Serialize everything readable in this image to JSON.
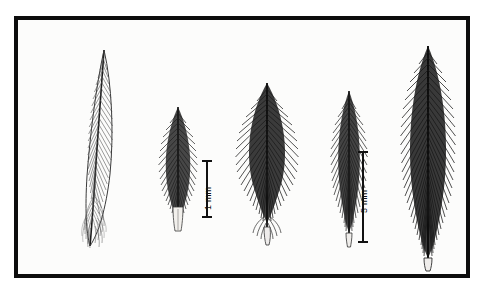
{
  "figure": {
    "name": "feather-plate",
    "background_color": "#ffffff",
    "frame_color": "#0d0d0d",
    "plate_background": "#fcfcfb",
    "ink_color": "#1a1a1a"
  },
  "specimens": [
    {
      "id": "specimen-1",
      "name": "contour-feather-whole",
      "description": "long slender whole contour feather with downy base"
    },
    {
      "id": "specimen-2",
      "name": "body-feather-small",
      "description": "short plumulaceous body feather with broad rachis base"
    },
    {
      "id": "specimen-3",
      "name": "body-feather-wide",
      "description": "broad ovate downy feather with paired afterfeather base"
    },
    {
      "id": "specimen-4",
      "name": "body-feather-narrow",
      "description": "narrow elongate downy feather"
    },
    {
      "id": "specimen-5",
      "name": "contour-feather-large",
      "description": "largest pennaceous feather with dense barbs"
    }
  ],
  "scale_bars": [
    {
      "id": "scale-bar-1-mm",
      "name": "scale-bar-1mm",
      "label": "1 mm",
      "length_px": 58,
      "orientation": "vertical"
    },
    {
      "id": "scale-bar-5-mm",
      "name": "scale-bar-5mm",
      "label": "5 mm",
      "length_px": 92,
      "orientation": "vertical"
    }
  ]
}
